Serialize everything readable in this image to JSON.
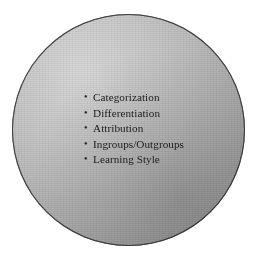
{
  "figure": {
    "kind": "concept-circle-diagram",
    "background_color": "#ffffff",
    "shape": {
      "name": "shaded-circle",
      "fill_light": "#d9d9d9",
      "fill_dark": "#969696",
      "outline_color": "#2d2d2d"
    },
    "bullet_glyph": "•",
    "items": [
      {
        "label": "Categorization"
      },
      {
        "label": "Differentiation"
      },
      {
        "label": "Attribution"
      },
      {
        "label": "Ingroups/Outgroups"
      },
      {
        "label": "Learning Style"
      }
    ]
  }
}
